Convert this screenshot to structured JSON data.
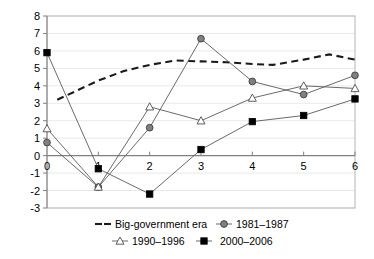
{
  "chart_data": {
    "type": "line",
    "title": "",
    "subtitle": "",
    "xlabel": "",
    "ylabel": "",
    "xlim": [
      0,
      6
    ],
    "ylim": [
      -3,
      8
    ],
    "grid": true,
    "legend_position": "bottom",
    "x": [
      0,
      1,
      2,
      3,
      4,
      5,
      6
    ],
    "x_tick_labels": [
      "0",
      "1",
      "2",
      "3",
      "4",
      "5",
      "6"
    ],
    "y_tick_labels": [
      "8",
      "7",
      "6",
      "5",
      "4",
      "3",
      "2",
      "1",
      "0",
      "-1",
      "-2",
      "-3"
    ],
    "y_ticks": [
      8,
      7,
      6,
      5,
      4,
      3,
      2,
      1,
      0,
      -1,
      -2,
      -3
    ],
    "series": [
      {
        "name": "Big-government era",
        "marker": "none",
        "style": "dashed",
        "color": "#1a1a1a",
        "x": [
          0.2,
          0.6,
          1.0,
          1.5,
          2.0,
          2.5,
          3.0,
          3.5,
          4.0,
          4.4,
          5.0,
          5.5,
          6.0
        ],
        "values": [
          3.2,
          3.75,
          4.3,
          4.85,
          5.2,
          5.45,
          5.4,
          5.35,
          5.25,
          5.2,
          5.5,
          5.8,
          5.5
        ]
      },
      {
        "name": "1981–1987",
        "marker": "circle",
        "style": "solid",
        "color": "#808080",
        "values": [
          0.75,
          -1.8,
          1.6,
          6.7,
          4.25,
          3.5,
          4.6
        ]
      },
      {
        "name": "1990–1996",
        "marker": "triangle",
        "style": "solid",
        "color": "#ffffff",
        "values": [
          1.55,
          -1.8,
          2.8,
          2.0,
          3.3,
          4.0,
          3.85
        ]
      },
      {
        "name": "2000–2006",
        "marker": "square",
        "style": "solid",
        "color": "#000000",
        "values": [
          5.9,
          -0.75,
          -2.2,
          0.35,
          1.95,
          2.3,
          3.25
        ]
      }
    ]
  },
  "legend": {
    "entries": [
      {
        "label": "Big-government era",
        "marker": "dashed-line-swatch"
      },
      {
        "label": "1981–1987",
        "marker": "gray-circle-swatch"
      },
      {
        "label": "1990–1996",
        "marker": "open-triangle-swatch"
      },
      {
        "label": "2000–2006",
        "marker": "black-square-swatch"
      }
    ]
  }
}
